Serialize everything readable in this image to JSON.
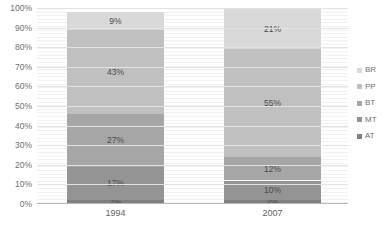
{
  "chart_data": {
    "type": "bar",
    "subtype": "100% stacked column",
    "title": "",
    "xlabel": "",
    "ylabel": "",
    "categories": [
      "1994",
      "2007"
    ],
    "ylim": [
      0,
      100
    ],
    "ytick_labels": [
      "0%",
      "10%",
      "20%",
      "30%",
      "40%",
      "50%",
      "60%",
      "70%",
      "80%",
      "90%",
      "100%"
    ],
    "ytick_values": [
      0,
      10,
      20,
      30,
      40,
      50,
      60,
      70,
      80,
      90,
      100
    ],
    "grid": true,
    "grid_orientation": "horizontal",
    "legend_position": "right",
    "stack_order_bottom_to_top": [
      "AT",
      "MT",
      "BT",
      "PP",
      "BR"
    ],
    "series": [
      {
        "name": "AT",
        "color": "#808080",
        "values": [
          2,
          2
        ],
        "labels": [
          "2%",
          "2%"
        ]
      },
      {
        "name": "MT",
        "color": "#949494",
        "values": [
          17,
          10
        ],
        "labels": [
          "17%",
          "10%"
        ]
      },
      {
        "name": "BT",
        "color": "#a6a6a6",
        "values": [
          27,
          12
        ],
        "labels": [
          "27%",
          "12%"
        ]
      },
      {
        "name": "PP",
        "color": "#c0c0c0",
        "values": [
          43,
          55
        ],
        "labels": [
          "43%",
          "55%"
        ]
      },
      {
        "name": "BR",
        "color": "#d9d9d9",
        "values": [
          9,
          21
        ],
        "labels": [
          "9%",
          "21%"
        ]
      }
    ]
  },
  "legend": {
    "items": [
      {
        "label": "BR",
        "color": "#d9d9d9"
      },
      {
        "label": "PP",
        "color": "#c0c0c0"
      },
      {
        "label": "BT",
        "color": "#a6a6a6"
      },
      {
        "label": "MT",
        "color": "#949494"
      },
      {
        "label": "AT",
        "color": "#808080"
      }
    ]
  },
  "axis": {
    "y_labels": [
      "100%",
      "90%",
      "80%",
      "70%",
      "60%",
      "50%",
      "40%",
      "30%",
      "20%",
      "10%",
      "0%"
    ],
    "x_labels": [
      "1994",
      "2007"
    ]
  },
  "title_remnant": ""
}
